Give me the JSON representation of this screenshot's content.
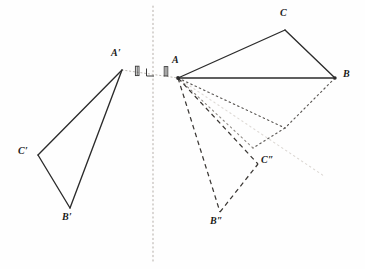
{
  "figure": {
    "width": 365,
    "height": 269,
    "background_color": "#fefefe",
    "stroke_color": "#2b2b2b",
    "mirror_line_color": "#b9b3ae",
    "faint_ray_color": "#d8d4d0"
  },
  "mirror_line": {
    "name": "axis-of-reflection",
    "x": 153,
    "y_top": 6,
    "y_bottom": 262,
    "style": "dotted"
  },
  "congruence_marks": {
    "tick_left": {
      "x": 137,
      "y": 72
    },
    "tick_right": {
      "x": 166,
      "y": 72
    },
    "right_angle": {
      "x": 153,
      "y": 72,
      "size": 7
    }
  },
  "triangles": [
    {
      "name": "original-triangle",
      "id": "ABC",
      "style": "solid",
      "vertices": [
        {
          "label": "A",
          "prime": "",
          "x": 178,
          "y": 78,
          "label_x": 172,
          "label_y": 62
        },
        {
          "label": "B",
          "prime": "",
          "x": 335,
          "y": 78,
          "label_x": 344,
          "label_y": 72
        },
        {
          "label": "C",
          "prime": "",
          "x": 285,
          "y": 30,
          "label_x": 281,
          "label_y": 12
        }
      ]
    },
    {
      "name": "reflected-triangle",
      "id": "A'B'C'",
      "style": "solid",
      "vertices": [
        {
          "label": "A",
          "prime": "'",
          "x": 122,
          "y": 70,
          "label_x": 113,
          "label_y": 54
        },
        {
          "label": "B",
          "prime": "'",
          "x": 70,
          "y": 208,
          "label_x": 64,
          "label_y": 212
        },
        {
          "label": "C",
          "prime": "'",
          "x": 38,
          "y": 155,
          "label_x": 20,
          "label_y": 148
        }
      ]
    },
    {
      "name": "intermediate-rotated-triangle",
      "id": "dotted",
      "style": "dotted",
      "vertices": [
        {
          "label": "",
          "prime": "",
          "x": 178,
          "y": 78
        },
        {
          "label": "",
          "prime": "",
          "x": 285,
          "y": 128
        },
        {
          "label": "",
          "prime": "",
          "x": 253,
          "y": 148
        }
      ]
    },
    {
      "name": "rotated-triangle",
      "id": "A B'' C''",
      "style": "dashed",
      "vertices": [
        {
          "label": "A",
          "prime": "",
          "x": 178,
          "y": 78
        },
        {
          "label": "B",
          "prime": "''",
          "x": 220,
          "y": 212,
          "label_x": 212,
          "label_y": 216
        },
        {
          "label": "C",
          "prime": "''",
          "x": 258,
          "y": 164,
          "label_x": 262,
          "label_y": 158
        }
      ]
    }
  ],
  "construction_rays": [
    {
      "name": "ray-to-B",
      "from_x": 178,
      "from_y": 78,
      "to_x": 335,
      "to_y": 78,
      "style": "solid"
    },
    {
      "name": "ray-dotted-1",
      "from_x": 178,
      "from_y": 78,
      "to_x": 285,
      "to_y": 128,
      "style": "dotted"
    },
    {
      "name": "ray-dotted-2",
      "from_x": 178,
      "from_y": 78,
      "to_x": 253,
      "to_y": 148,
      "style": "dotted"
    },
    {
      "name": "ray-faint-long",
      "from_x": 178,
      "from_y": 78,
      "to_x": 322,
      "to_y": 174,
      "style": "faint-dotted"
    },
    {
      "name": "ray-dashed-to-Cdd",
      "from_x": 178,
      "from_y": 78,
      "to_x": 258,
      "to_y": 164,
      "style": "dashed"
    },
    {
      "name": "ray-dashed-to-Bdd",
      "from_x": 178,
      "from_y": 78,
      "to_x": 220,
      "to_y": 212,
      "style": "dashed"
    }
  ],
  "reflection_ray": {
    "name": "reflection-connector",
    "from_x": 122,
    "from_y": 70,
    "to_x": 178,
    "to_y": 78,
    "style": "dotted"
  },
  "labels": {
    "A": "A",
    "B": "B",
    "C": "C",
    "A_prime": "A",
    "B_prime": "B",
    "C_prime": "C",
    "B_double_prime": "B",
    "C_double_prime": "C",
    "single_prime": "′",
    "double_prime": "″"
  }
}
